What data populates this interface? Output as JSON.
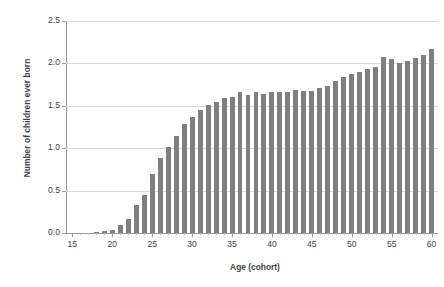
{
  "chart_data": {
    "type": "bar",
    "title": "",
    "xlabel": "Age (cohort)",
    "ylabel": "Number of children ever born",
    "xlim": [
      14.2,
      60.8
    ],
    "ylim": [
      0.0,
      2.5
    ],
    "grid": true,
    "legend": null,
    "bar_color": "#7f7f7f",
    "gridline_color": "#d9d9d9",
    "axis_color": "#9a9a9a",
    "y_ticks": [
      "0.0",
      "0.5",
      "1.0",
      "1.5",
      "2.0",
      "2.5"
    ],
    "y_tick_values": [
      0.0,
      0.5,
      1.0,
      1.5,
      2.0,
      2.5
    ],
    "x_ticks": [
      "15",
      "20",
      "25",
      "30",
      "35",
      "40",
      "45",
      "50",
      "55",
      "60"
    ],
    "x_tick_values": [
      15,
      20,
      25,
      30,
      35,
      40,
      45,
      50,
      55,
      60
    ],
    "categories": [
      15,
      16,
      17,
      18,
      19,
      20,
      21,
      22,
      23,
      24,
      25,
      26,
      27,
      28,
      29,
      30,
      31,
      32,
      33,
      34,
      35,
      36,
      37,
      38,
      39,
      40,
      41,
      42,
      43,
      44,
      45,
      46,
      47,
      48,
      49,
      50,
      51,
      52,
      53,
      54,
      55,
      56,
      57,
      58,
      59,
      60
    ],
    "values": [
      0.0,
      0.0,
      0.0,
      0.01,
      0.02,
      0.03,
      0.1,
      0.17,
      0.33,
      0.45,
      0.7,
      0.88,
      1.01,
      1.14,
      1.29,
      1.37,
      1.45,
      1.51,
      1.55,
      1.59,
      1.6,
      1.66,
      1.63,
      1.66,
      1.64,
      1.66,
      1.66,
      1.66,
      1.69,
      1.67,
      1.68,
      1.71,
      1.73,
      1.79,
      1.84,
      1.87,
      1.9,
      1.94,
      1.96,
      2.07,
      2.05,
      2.0,
      2.03,
      2.06,
      2.1,
      2.17
    ]
  }
}
